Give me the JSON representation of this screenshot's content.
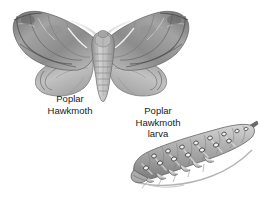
{
  "page": {
    "background_color": "#ffffff",
    "width": 260,
    "height": 199
  },
  "illustration": {
    "style": "pencil-grayscale-natural-history",
    "palette": {
      "ink_dark": "#4a4a4a",
      "ink_mid": "#8a8a8a",
      "ink_light": "#c9c9c9",
      "highlight": "#f2f2f2",
      "text": "#1a1a1a"
    }
  },
  "figures": [
    {
      "id": "poplar-hawkmoth",
      "subject": "Poplar Hawkmoth",
      "view": "dorsal wings spread",
      "parts": [
        "forewing-left",
        "forewing-right",
        "hindwing-left",
        "hindwing-right",
        "thorax",
        "abdomen",
        "antenna-left",
        "antenna-right"
      ]
    },
    {
      "id": "poplar-hawkmoth-larva",
      "subject": "Poplar Hawkmoth larva",
      "view": "lateral, head to lower-left, caudal horn upper-right",
      "parts": [
        "body",
        "spiracle-spots",
        "oblique-stripes",
        "prolegs",
        "head",
        "caudal-horn"
      ]
    }
  ],
  "captions": {
    "moth": {
      "lines": [
        "Poplar",
        "Hawkmoth"
      ],
      "line1": "Poplar",
      "line2": "Hawkmoth"
    },
    "larva": {
      "lines": [
        "Poplar",
        "Hawkmoth",
        "larva"
      ],
      "line1": "Poplar",
      "line2": "Hawkmoth",
      "line3": "larva"
    }
  }
}
